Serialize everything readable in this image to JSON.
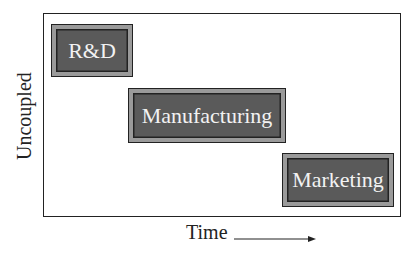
{
  "diagram": {
    "y_axis_label": "Uncoupled",
    "x_axis_label": "Time",
    "phases": [
      {
        "label": "R&D",
        "order": 1
      },
      {
        "label": "Manufacturing",
        "order": 2
      },
      {
        "label": "Marketing",
        "order": 3
      }
    ],
    "colors": {
      "box_fill": "#5a5a5a",
      "box_bevel": "#9a9a9a",
      "text": "#f2f2f2",
      "frame": "#222222"
    }
  }
}
